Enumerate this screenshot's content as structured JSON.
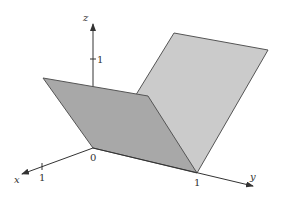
{
  "figure": {
    "type": "3d-surface-diagram",
    "colors": {
      "background": "#ffffff",
      "dark_plane": "#a8a8a8",
      "light_plane": "#cbcbcb",
      "edge": "#555555",
      "axis": "#333333"
    },
    "axes": {
      "x": {
        "label": "x",
        "tick_label": "1"
      },
      "y": {
        "label": "y",
        "tick_label": "1"
      },
      "z": {
        "label": "z",
        "tick_label": "1"
      },
      "origin_label": "0"
    }
  }
}
